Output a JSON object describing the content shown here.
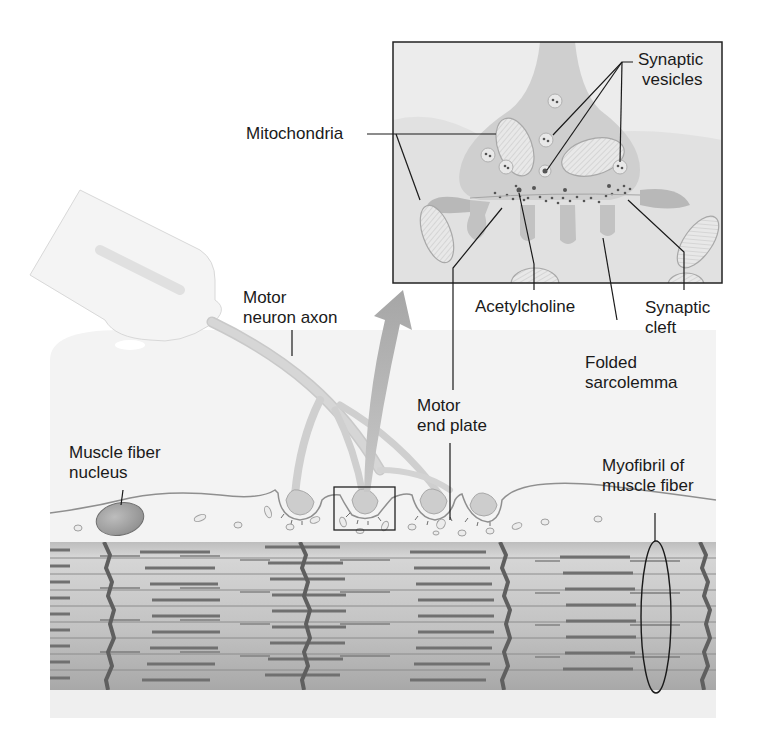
{
  "diagram": {
    "labels": {
      "synaptic_vesicles": [
        "Synaptic",
        "vesicles"
      ],
      "mitochondria": [
        "Mitochondria"
      ],
      "motor_neuron_axon": [
        "Motor",
        "neuron axon"
      ],
      "acetylcholine": [
        "Acetylcholine"
      ],
      "synaptic_cleft": [
        "Synaptic",
        "cleft"
      ],
      "folded_sarcolemma": [
        "Folded",
        "sarcolemma"
      ],
      "motor_end_plate": [
        "Motor",
        "end plate"
      ],
      "muscle_fiber_nucleus": [
        "Muscle fiber",
        "nucleus"
      ],
      "myofibril": [
        "Myofibril of",
        "muscle fiber"
      ]
    },
    "colors": {
      "background": "#ffffff",
      "tissue_bg": "#f2f2f2",
      "cytoplasm": "#d9d9d9",
      "terminal": "#c4c4c4",
      "band_light": "#cfcfcf",
      "band_dark": "#a9a9a9",
      "z_line": "#6b6b6b",
      "filament": "#7a7a7a",
      "leader_line": "#1a1a1a"
    }
  }
}
